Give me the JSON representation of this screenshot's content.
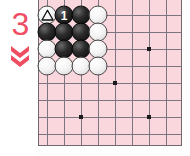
{
  "diagram": {
    "move_number_label": "3",
    "arrow_glyph": "double-chevron-down",
    "accent_color": "#ef4e62"
  },
  "board": {
    "background_color": "#f9d7dd",
    "line_color": "#7b7580",
    "border_color": "#6e6870",
    "cols": 9,
    "rows": 9,
    "spacing": 17,
    "origin_x": 8,
    "origin_y": 18,
    "star_points": [
      {
        "col": 6,
        "row": 2
      },
      {
        "col": 4,
        "row": 4
      },
      {
        "col": 2,
        "row": 6
      },
      {
        "col": 6,
        "row": 6
      }
    ]
  },
  "stones": [
    {
      "col": 0,
      "row": 0,
      "color": "white",
      "marker": "triangle",
      "label": ""
    },
    {
      "col": 1,
      "row": 0,
      "color": "black",
      "marker": "number",
      "label": "1"
    },
    {
      "col": 2,
      "row": 0,
      "color": "black",
      "marker": "",
      "label": ""
    },
    {
      "col": 3,
      "row": 0,
      "color": "white",
      "marker": "",
      "label": ""
    },
    {
      "col": 0,
      "row": 1,
      "color": "black",
      "marker": "",
      "label": ""
    },
    {
      "col": 1,
      "row": 1,
      "color": "black",
      "marker": "",
      "label": ""
    },
    {
      "col": 2,
      "row": 1,
      "color": "black",
      "marker": "",
      "label": ""
    },
    {
      "col": 3,
      "row": 1,
      "color": "white",
      "marker": "",
      "label": ""
    },
    {
      "col": 0,
      "row": 2,
      "color": "white",
      "marker": "",
      "label": ""
    },
    {
      "col": 1,
      "row": 2,
      "color": "black",
      "marker": "",
      "label": ""
    },
    {
      "col": 2,
      "row": 2,
      "color": "black",
      "marker": "",
      "label": ""
    },
    {
      "col": 3,
      "row": 2,
      "color": "white",
      "marker": "",
      "label": ""
    },
    {
      "col": 0,
      "row": 3,
      "color": "white",
      "marker": "",
      "label": ""
    },
    {
      "col": 1,
      "row": 3,
      "color": "white",
      "marker": "",
      "label": ""
    },
    {
      "col": 2,
      "row": 3,
      "color": "white",
      "marker": "",
      "label": ""
    },
    {
      "col": 3,
      "row": 3,
      "color": "white",
      "marker": "",
      "label": ""
    }
  ]
}
